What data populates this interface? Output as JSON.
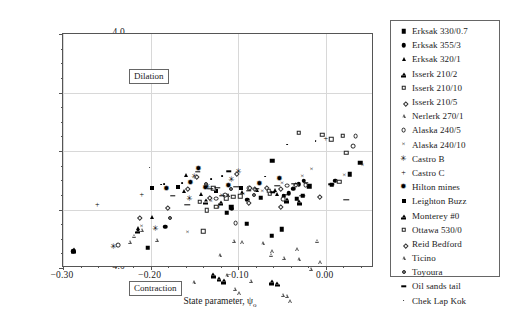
{
  "figure": {
    "annotations": [
      {
        "name": "dilation",
        "text": "Dilation"
      },
      {
        "name": "contraction",
        "text": "Contraction"
      }
    ]
  },
  "chart_data": {
    "type": "scatter",
    "title": "",
    "xlabel": "State parameter, ψ₀",
    "ylabel": "Volumetric strain, εᵥ (%) at peak φ'",
    "xlim": [
      -0.3,
      0.055
    ],
    "ylim": [
      4.0,
      -4.0
    ],
    "y_inverted": true,
    "grid": true,
    "legend_position": "right-outside",
    "xticks": [
      -0.3,
      -0.2,
      -0.1,
      0.0
    ],
    "xticklabels": [
      "−0.30",
      "−0.20",
      "−0.10",
      "0.00"
    ],
    "xminor_step": 0.02,
    "yticks": [
      -4.0,
      -2.0,
      0.0,
      2.0,
      4.0
    ],
    "yticklabels": [
      "−4.0",
      "−2.0",
      "0.0",
      "2.0",
      "4.0"
    ],
    "yminor_step": 0.5,
    "series": [
      {
        "name": "Erksak 330/0.7",
        "marker": "sq-f",
        "points": [
          [
            -0.2035,
            -3.31
          ],
          [
            -0.113,
            -2.11
          ],
          [
            -0.0905,
            -2.48
          ],
          [
            -0.0615,
            -2.89
          ],
          [
            -0.0505,
            -2.68
          ],
          [
            -0.108,
            -1.92
          ],
          [
            -0.0745,
            -1.6
          ],
          [
            -0.061,
            -0.33
          ],
          [
            -0.033,
            -1.63
          ],
          [
            -0.0265,
            -1.52
          ],
          [
            -0.019,
            -1.2
          ],
          [
            0.0065,
            -1.16
          ],
          [
            0.027,
            -0.79
          ],
          [
            0.039,
            -0.4
          ]
        ]
      },
      {
        "name": "Erksak 355/3",
        "marker": "ci-f",
        "points": [
          [
            -0.2885,
            -3.42
          ],
          [
            -0.1835,
            -2.58
          ],
          [
            -0.1075,
            -1.97
          ],
          [
            -0.09,
            -1.66
          ],
          [
            -0.048,
            -1.55
          ],
          [
            -0.0425,
            -1.44
          ],
          [
            -0.0375,
            -1.29
          ],
          [
            -0.031,
            -1.13
          ],
          [
            -0.025,
            -1.02
          ],
          [
            0.0105,
            -1.01
          ]
        ]
      },
      {
        "name": "Erksak 320/1",
        "marker": "tri-f",
        "points": [
          [
            -0.215,
            -2.62
          ],
          [
            -0.199,
            -2.24
          ],
          [
            -0.162,
            -1.37
          ],
          [
            -0.1595,
            -0.82
          ],
          [
            -0.1425,
            -1.48
          ],
          [
            -0.1115,
            -1.5
          ],
          [
            -0.096,
            -1.4
          ],
          [
            -0.079,
            -1.32
          ],
          [
            -0.0585,
            -1.33
          ],
          [
            -0.056,
            -1.47
          ],
          [
            -0.0375,
            -1.27
          ]
        ]
      },
      {
        "name": "Isserk 210/2",
        "marker": "pent",
        "points": [
          [
            -0.288,
            -3.35
          ],
          [
            -0.215,
            -2.58
          ],
          [
            -0.137,
            -1.48
          ],
          [
            -0.12,
            -1.42
          ],
          [
            -0.0445,
            -1.23
          ],
          [
            -0.0305,
            -1.2
          ]
        ]
      },
      {
        "name": "Isserk 210/10",
        "marker": "sq-o",
        "points": [
          [
            -0.14,
            -2.74
          ],
          [
            -0.136,
            -2.03
          ],
          [
            -0.125,
            -1.9
          ],
          [
            -0.1135,
            -1.61
          ],
          [
            -0.106,
            -1.57
          ],
          [
            -0.098,
            -1.55
          ],
          [
            -0.064,
            -1.44
          ],
          [
            0.015,
            -1.05
          ],
          [
            0.019,
            0.52
          ],
          [
            0.023,
            -0.06
          ],
          [
            -0.004,
            0.55
          ],
          [
            -0.031,
            0.63
          ]
        ]
      },
      {
        "name": "Isserk 210/5",
        "marker": "di-o",
        "points": [
          [
            -0.215,
            -2.21
          ],
          [
            -0.182,
            -1.88
          ],
          [
            -0.16,
            -1.23
          ],
          [
            -0.135,
            -1.54
          ],
          [
            -0.0895,
            -1.7
          ],
          [
            -0.083,
            -1.24
          ],
          [
            -0.069,
            -1.2
          ],
          [
            -0.054,
            -1.86
          ],
          [
            -0.036,
            -1.1
          ],
          [
            -0.009,
            -1.5
          ]
        ]
      },
      {
        "name": "Nerlerk 270/1",
        "marker": "tri-o",
        "points": [
          [
            -0.224,
            -2.49
          ],
          [
            -0.219,
            -2.15
          ],
          [
            -0.21,
            -1.8
          ],
          [
            -0.193,
            -2.0
          ],
          [
            -0.151,
            -3.32
          ],
          [
            -0.113,
            -2.94
          ],
          [
            -0.121,
            -2.13
          ],
          [
            -0.105,
            -1.5
          ],
          [
            -0.0955,
            -1.41
          ],
          [
            -0.072,
            -1.3
          ],
          [
            -0.061,
            -1.45
          ],
          [
            -0.048,
            -1.52
          ],
          [
            -0.031,
            -1.44
          ],
          [
            -0.0325,
            -0.97
          ],
          [
            -0.01,
            -0.53
          ],
          [
            -0.0065,
            -1.14
          ],
          [
            -0.0625,
            -0.74
          ]
        ]
      },
      {
        "name": "Alaska 240/5",
        "marker": "ci-o",
        "points": [
          [
            -0.237,
            -3.22
          ],
          [
            -0.125,
            -1.63
          ],
          [
            -0.115,
            -1.5
          ],
          [
            -0.103,
            -2.46
          ],
          [
            -0.0875,
            -1.28
          ],
          [
            -0.049,
            -1.64
          ],
          [
            -0.044,
            -1.18
          ],
          [
            -0.023,
            -1.16
          ],
          [
            0.031,
            0.16
          ],
          [
            0.034,
            0.5
          ]
        ]
      },
      {
        "name": "Alaska 240/10",
        "marker": "x",
        "points": [
          [
            -0.2105,
            -2.58
          ],
          [
            -0.158,
            -2.81
          ],
          [
            -0.131,
            -1.73
          ],
          [
            -0.1225,
            -1.96
          ],
          [
            -0.119,
            -1.53
          ],
          [
            -0.094,
            -1.5
          ],
          [
            -0.0725,
            -1.4
          ],
          [
            -0.05,
            -1.14
          ],
          [
            -0.027,
            -0.88
          ],
          [
            -0.0165,
            -0.66
          ],
          [
            0.021,
            -0.87
          ],
          [
            0.042,
            -0.51
          ]
        ]
      },
      {
        "name": "Castro B",
        "marker": "star",
        "points": [
          [
            -0.242,
            -3.27
          ],
          [
            -0.194,
            -2.65
          ],
          [
            -0.156,
            -1.64
          ],
          [
            -0.1355,
            -1.22
          ],
          [
            -0.108,
            -1.0
          ],
          [
            -0.15,
            -0.9
          ],
          [
            -0.1,
            -0.72
          ]
        ]
      },
      {
        "name": "Castro C",
        "marker": "plus",
        "points": [
          [
            -0.261,
            -1.85
          ],
          [
            0.0,
            0.42
          ],
          [
            -0.21,
            -1.5
          ]
        ]
      },
      {
        "name": "Hilton mines",
        "marker": "star2",
        "points": [
          [
            -0.182,
            -1.3
          ],
          [
            -0.155,
            -1.1
          ],
          [
            -0.137,
            -1.27
          ],
          [
            -0.111,
            -1.21
          ],
          [
            -0.145,
            -0.6
          ],
          [
            -0.076,
            -1.13
          ],
          [
            -0.053,
            -0.97
          ]
        ]
      },
      {
        "name": "Leighton Buzz",
        "marker": "sq-f2",
        "points": [
          [
            -0.198,
            -1.25
          ],
          [
            -0.169,
            -1.22
          ],
          [
            -0.1255,
            -1.35
          ],
          [
            -0.0965,
            -1.28
          ]
        ]
      },
      {
        "name": "Monterey #0",
        "marker": "pent2",
        "points": [
          [
            -0.1285,
            -1.26
          ],
          [
            -0.122,
            -1.29
          ],
          [
            -0.1168,
            -1.27
          ],
          [
            -0.062,
            -1.19
          ],
          [
            -0.0555,
            -1.15
          ]
        ]
      },
      {
        "name": "Ottawa 530/0",
        "marker": "sq-o2",
        "points": [
          [
            -0.144,
            -1.73
          ],
          [
            -0.1285,
            -1.28
          ],
          [
            -0.065,
            -1.36
          ],
          [
            0.006,
            0.4
          ]
        ]
      },
      {
        "name": "Reid Bedford",
        "marker": "di-o2",
        "points": [
          [
            -0.1495,
            -0.82
          ],
          [
            -0.089,
            -1.18
          ],
          [
            -0.1035,
            -0.73
          ],
          [
            -0.054,
            -1.22
          ]
        ]
      },
      {
        "name": "Ticino",
        "marker": "tri-o2",
        "points": [
          [
            -0.104,
            -1.25
          ],
          [
            -0.099,
            -1.28
          ],
          [
            -0.0855,
            -0.7
          ],
          [
            -0.0405,
            -1.27
          ],
          [
            -0.0495,
            -0.92
          ],
          [
            -0.017,
            0.12
          ],
          [
            -0.0445,
            -0.68
          ]
        ]
      },
      {
        "name": "Toyoura",
        "marker": "ci-o2",
        "points": [
          [
            -0.178,
            -2.3
          ],
          [
            -0.137,
            -1.14
          ],
          [
            -0.108,
            -1.29
          ],
          [
            -0.0825,
            -1.5
          ]
        ]
      },
      {
        "name": "Oil sands tail",
        "marker": "dash",
        "points": [
          [
            -0.175,
            -1.53
          ],
          [
            -0.1585,
            -1.83
          ],
          [
            -0.132,
            -1.29
          ],
          [
            -0.124,
            -1.25
          ],
          [
            -0.118,
            -1.52
          ],
          [
            -0.1025,
            -1.22
          ],
          [
            -0.088,
            -1.35
          ],
          [
            -0.079,
            -1.3
          ],
          [
            -0.0605,
            -1.41
          ],
          [
            -0.047,
            -1.5
          ],
          [
            -0.0555,
            -1.18
          ],
          [
            -0.036,
            -1.12
          ],
          [
            -0.023,
            -1.09
          ],
          [
            -0.027,
            -1.53
          ],
          [
            0.006,
            -1.14
          ],
          [
            0.023,
            -1.66
          ],
          [
            -0.146,
            -0.72
          ],
          [
            -0.111,
            -0.69
          ]
        ]
      },
      {
        "name": "Chek Lap Kok",
        "marker": "dot",
        "points": [
          [
            -0.201,
            -0.57
          ],
          [
            -0.164,
            -1.09
          ],
          [
            -0.131,
            -0.95
          ],
          [
            -0.1185,
            -0.85
          ],
          [
            -0.1845,
            -1.12
          ],
          [
            -0.069,
            -0.88
          ],
          [
            -0.044,
            0.22
          ],
          [
            -0.0115,
            0.35
          ],
          [
            -0.188,
            -1.15
          ],
          [
            -0.1545,
            -1.02
          ]
        ]
      }
    ]
  },
  "legend": {
    "items": [
      {
        "label": "Erksak 330/0.7",
        "marker": "sq-f"
      },
      {
        "label": "Erksak 355/3",
        "marker": "ci-f"
      },
      {
        "label": "Erksak 320/1",
        "marker": "tri-f"
      },
      {
        "label": "Isserk 210/2",
        "marker": "pent"
      },
      {
        "label": "Isserk 210/10",
        "marker": "sq-o"
      },
      {
        "label": "Isserk 210/5",
        "marker": "di-o"
      },
      {
        "label": "Nerlerk 270/1",
        "marker": "tri-o"
      },
      {
        "label": "Alaska 240/5",
        "marker": "ci-o"
      },
      {
        "label": "Alaska 240/10",
        "marker": "x"
      },
      {
        "label": "Castro B",
        "marker": "star"
      },
      {
        "label": "Castro C",
        "marker": "plus"
      },
      {
        "label": "Hilton mines",
        "marker": "star2"
      },
      {
        "label": "Leighton Buzz",
        "marker": "sq-f2"
      },
      {
        "label": "Monterey #0",
        "marker": "pent2"
      },
      {
        "label": "Ottawa 530/0",
        "marker": "sq-o2"
      },
      {
        "label": "Reid Bedford",
        "marker": "di-o2"
      },
      {
        "label": "Ticino",
        "marker": "tri-o2"
      },
      {
        "label": "Toyoura",
        "marker": "ci-o2"
      },
      {
        "label": "Oil sands tail",
        "marker": "dash"
      },
      {
        "label": "Chek Lap Kok",
        "marker": "dot"
      }
    ]
  }
}
